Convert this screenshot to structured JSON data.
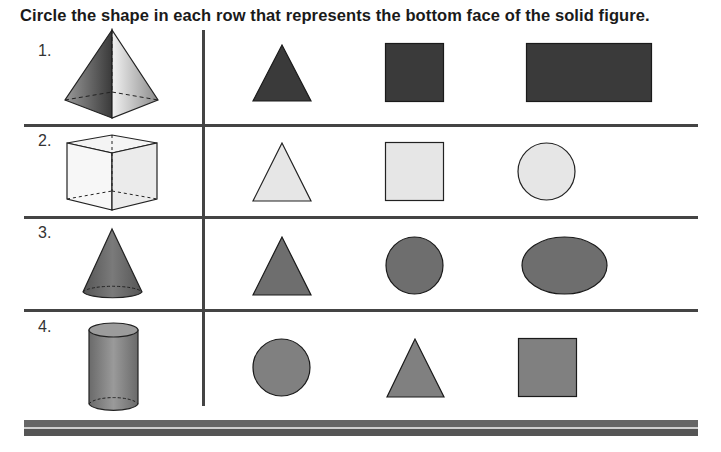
{
  "worksheet": {
    "instruction": "Circle the shape in each row that represents the bottom face of the solid figure.",
    "colors": {
      "row1_fill": "#3a3a3a",
      "row2_fill": "#e6e6e6",
      "row3_fill": "#6e6e6e",
      "row4_fill": "#808080",
      "line": "#444444"
    },
    "rows": [
      {
        "number": "1.",
        "solid": "square-pyramid",
        "choices": [
          "triangle",
          "square",
          "rectangle"
        ]
      },
      {
        "number": "2.",
        "solid": "cube",
        "choices": [
          "triangle",
          "square",
          "circle"
        ]
      },
      {
        "number": "3.",
        "solid": "cone",
        "choices": [
          "triangle",
          "circle",
          "oval"
        ]
      },
      {
        "number": "4.",
        "solid": "cylinder",
        "choices": [
          "circle",
          "triangle",
          "square"
        ]
      }
    ]
  }
}
